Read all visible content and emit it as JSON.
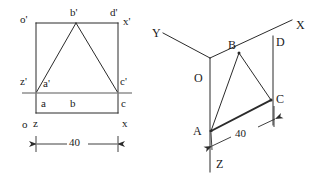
{
  "drawing": {
    "title": "Orthographic and isometric views of a triangular lamina",
    "stroke_color": "#2b2b2b",
    "reference_line_color": "#8a8a8a",
    "background": "#ffffff"
  },
  "orthographic_view": {
    "name": "front-and-top-view",
    "labels": {
      "top_left": "o'",
      "top_apex": "b'",
      "top_right_inner": "d'",
      "top_right": "x'",
      "mid_left": "z'",
      "mid_inner_left": "a'",
      "mid_right": "c'",
      "low_left": "a",
      "low_center": "b",
      "low_right": "c",
      "base_left_o": "o",
      "base_left_z": "z",
      "base_right_x": "x"
    },
    "dimension": {
      "value": "40",
      "name": "width-dimension"
    }
  },
  "isometric_view": {
    "name": "pictorial-view",
    "axes": {
      "y_axis": "Y",
      "x_axis": "X",
      "z_axis": "Z",
      "origin": "O"
    },
    "vertices": {
      "apex": "B",
      "right_top": "D",
      "right": "C",
      "bottom_left": "A"
    },
    "dimension": {
      "value": "40",
      "name": "edge-dimension"
    }
  }
}
